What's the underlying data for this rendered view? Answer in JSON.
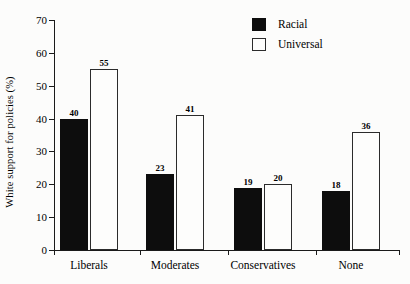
{
  "chart_data": {
    "type": "bar",
    "title": "",
    "subtitle": "",
    "xlabel": "",
    "ylabel": "White support for policies (%)",
    "categories": [
      "Liberals",
      "Moderates",
      "Conservatives",
      "None"
    ],
    "series": [
      {
        "name": "Racial",
        "color": "#0d0d0d",
        "fill": "solid",
        "values": [
          40,
          23,
          19,
          18
        ]
      },
      {
        "name": "Universal",
        "color": "#ffffff",
        "fill": "outline",
        "values": [
          55,
          41,
          20,
          36
        ]
      }
    ],
    "ylim": [
      0,
      70
    ],
    "ytick_values": [
      0,
      10,
      20,
      30,
      40,
      50,
      60,
      70
    ],
    "ytick_labels": [
      "0",
      "10",
      "20",
      "30",
      "40",
      "50",
      "60",
      "70"
    ],
    "value_labels": {
      "Liberals": {
        "Racial": "40",
        "Universal": "55"
      },
      "Moderates": {
        "Racial": "23",
        "Universal": "41"
      },
      "Conservatives": {
        "Racial": "19",
        "Universal": "20"
      },
      "None": {
        "Racial": "18",
        "Universal": "36"
      }
    },
    "grid": false,
    "legend_position": "top-right",
    "legend_entries": [
      "Racial",
      "Universal"
    ],
    "background_color": "#fcfcfb",
    "axis_color": "#1a1a1a"
  }
}
